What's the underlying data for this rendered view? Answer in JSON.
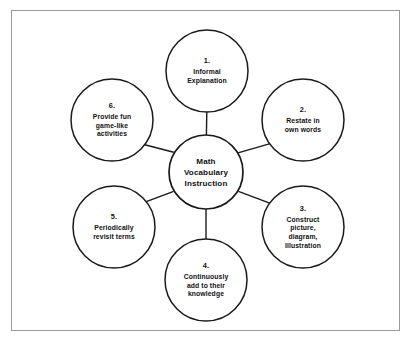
{
  "diagram": {
    "title": "Math Vocabulary Instruction",
    "frame": {
      "border_color": "#9a9a9a",
      "background_color": "#ffffff"
    },
    "style": {
      "circle_stroke_color": "#1a1a1a",
      "circle_fill_color": "#ffffff",
      "spoke_color": "#1a1a1a",
      "text_color": "#111111"
    },
    "center": {
      "label": "Math\nVocabulary\nInstruction"
    },
    "nodes": [
      {
        "index": "1.",
        "label": "Informal\nExplanation",
        "position": "top"
      },
      {
        "index": "2.",
        "label": "Restate in\nown words",
        "position": "upper-right"
      },
      {
        "index": "3.",
        "label": "Construct\npicture,\ndiagram,\nIllustration",
        "position": "lower-right"
      },
      {
        "index": "4.",
        "label": "Continuously\nadd to their\nknowledge",
        "position": "bottom"
      },
      {
        "index": "5.",
        "label": "Periodically\nrevisit terms",
        "position": "lower-left"
      },
      {
        "index": "6.",
        "label": "Provide fun\ngame-like\nactivities",
        "position": "upper-left"
      }
    ]
  }
}
